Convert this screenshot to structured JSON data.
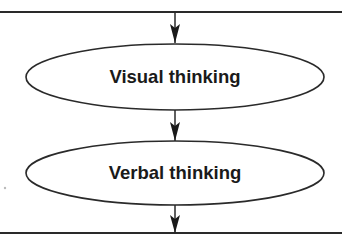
{
  "diagram": {
    "type": "flowchart",
    "direction": "top-to-bottom",
    "colors": {
      "stroke": "#2a2a2a",
      "text": "#1a1a1a",
      "background": "#ffffff"
    },
    "top_line": {
      "y": 12
    },
    "bottom_line": {
      "y": 233
    },
    "nodes": [
      {
        "id": "visual",
        "label": "Visual thinking",
        "shape": "ellipse",
        "cx": 175,
        "cy": 77,
        "rx": 149,
        "ry": 33
      },
      {
        "id": "verbal",
        "label": "Verbal thinking",
        "shape": "ellipse",
        "cx": 175,
        "cy": 173,
        "rx": 149,
        "ry": 32
      }
    ],
    "edges": [
      {
        "from": "top-line",
        "to": "visual"
      },
      {
        "from": "visual",
        "to": "verbal"
      },
      {
        "from": "verbal",
        "to": "bottom-line"
      }
    ]
  }
}
